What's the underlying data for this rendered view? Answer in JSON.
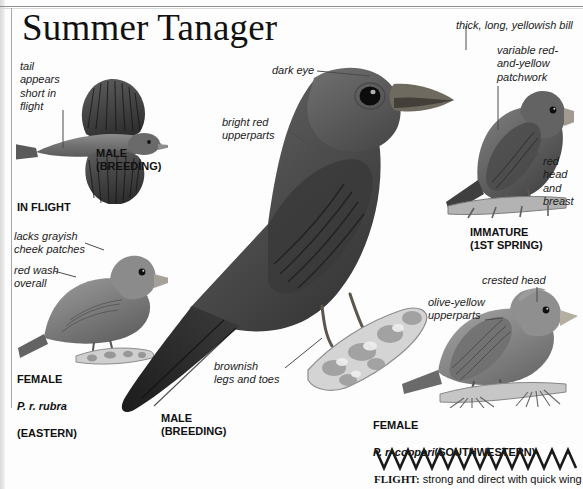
{
  "page": {
    "title": "Summer Tanager",
    "background": "#fdfdfd",
    "ink": "#1b1b1b"
  },
  "callouts": [
    {
      "name": "tail-appears-short",
      "text": "tail\nappears\nshort in\nflight"
    },
    {
      "name": "lacks-grayish-cheek",
      "text": "lacks grayish\ncheek patches"
    },
    {
      "name": "red-wash-overall",
      "text": "red wash\noverall"
    },
    {
      "name": "dark-eye",
      "text": "dark eye"
    },
    {
      "name": "bright-red-upperparts",
      "text": "bright red\nupperparts"
    },
    {
      "name": "brownish-legs-and-toes",
      "text": "brownish\nlegs and toes"
    },
    {
      "name": "thick-long-yellowish-bill",
      "text": "thick, long, yellowish bill"
    },
    {
      "name": "variable-patchwork",
      "text": "variable red-\nand-yellow\npatchwork"
    },
    {
      "name": "red-head-and-breast",
      "text": "red\nhead\nand\nbreast"
    },
    {
      "name": "crested-head",
      "text": "crested head"
    },
    {
      "name": "olive-yellow-upperparts",
      "text": "olive-yellow\nupperparts"
    }
  ],
  "plates": {
    "in_flight_label": "IN FLIGHT",
    "flight_male": "MALE\n(BREEDING)",
    "female_eastern_common": "FEMALE",
    "female_eastern_sci": "P. r. rubra",
    "female_eastern_range": "(EASTERN)",
    "main_male": "MALE\n(BREEDING)",
    "immature": "IMMATURE\n(1ST SPRING)",
    "female_sw_common": "FEMALE",
    "female_sw_sci": "P. r. cooperi",
    "female_sw_range": "(SOUTHWESTERN)"
  },
  "flight_note": {
    "label": "FLIGHT:",
    "text": " strong and direct with quick wing"
  }
}
